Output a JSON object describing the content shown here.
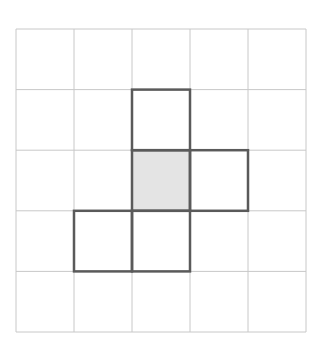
{
  "diagram": {
    "type": "grid-puzzle",
    "rows": 5,
    "cols": 5,
    "origin": {
      "x": 16,
      "y": 29
    },
    "cell_width": 58,
    "cell_height": 60.6,
    "colors": {
      "background": "#ffffff",
      "grid_line": "#c8c8c8",
      "outline": "#5a5a5a",
      "shaded_fill": "#e4e4e4"
    },
    "outlined_cells": [
      {
        "row": 1,
        "col": 2,
        "shaded": false
      },
      {
        "row": 2,
        "col": 2,
        "shaded": true
      },
      {
        "row": 2,
        "col": 3,
        "shaded": false
      },
      {
        "row": 3,
        "col": 1,
        "shaded": false
      },
      {
        "row": 3,
        "col": 2,
        "shaded": false
      }
    ]
  }
}
